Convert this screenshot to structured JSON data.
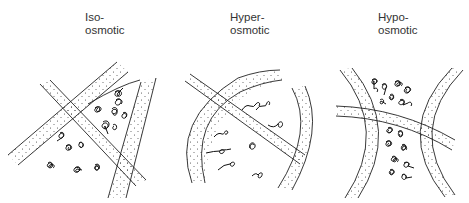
{
  "figure": {
    "panels": [
      {
        "id": "iso",
        "label_line1": "Iso-",
        "label_line2": "osmotic",
        "description": "Fibers with tightly coiled chains in the spaces between"
      },
      {
        "id": "hyper",
        "label_line1": "Hyper-",
        "label_line2": "osmotic",
        "description": "Fibers with loosely extended chains"
      },
      {
        "id": "hypo",
        "label_line1": "Hypo-",
        "label_line2": "osmotic",
        "description": "Fibers with densely packed coiled chains"
      }
    ],
    "colors": {
      "line": "#222222",
      "background": "#ffffff"
    }
  }
}
